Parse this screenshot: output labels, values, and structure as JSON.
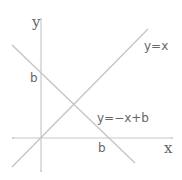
{
  "diagram": {
    "axes": {
      "x_label": "x",
      "y_label": "y"
    },
    "lines": [
      {
        "id": "line1",
        "label": "y=x"
      },
      {
        "id": "line2",
        "label": "y=−x+b"
      }
    ],
    "intercepts": {
      "y_intercept_label": "b",
      "x_intercept_label": "b"
    },
    "colors": {
      "lines": "#c4c4c4",
      "axes": "#c8c8c8",
      "text": "#666666"
    }
  }
}
